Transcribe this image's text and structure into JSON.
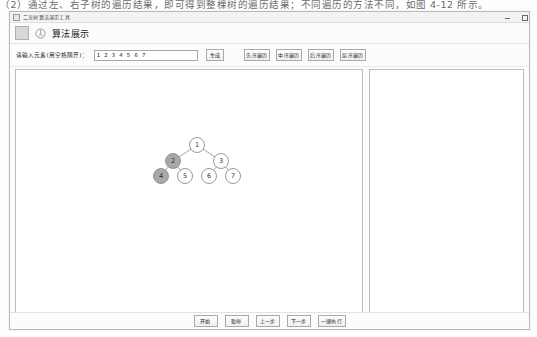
{
  "document_line": {
    "text": "（2）通过左、右子树的遍历结果，即可得到整棵树的遍历结果；不同遍历的方法不同，如图 4-12 所示。"
  },
  "window": {
    "titlebar_text": "二叉树算法演示工具",
    "controls": {
      "minimize": "minimize-icon",
      "close": "close-icon"
    },
    "app_icon": "app-square-icon",
    "logo_icon": "tree-logo-icon",
    "app_title": "算法展示"
  },
  "input_row": {
    "label": "请输入元素(用空格隔开)：",
    "value": "1 2 3 4 5 6 7",
    "placeholder": "1 2 3 4 5 6 7",
    "generate_button": "生成",
    "traversal_buttons": [
      {
        "label": "先序遍历",
        "name": "preorder-traversal-button"
      },
      {
        "label": "中序遍历",
        "name": "inorder-traversal-button"
      },
      {
        "label": "后序遍历",
        "name": "postorder-traversal-button"
      },
      {
        "label": "层序遍历",
        "name": "levelorder-traversal-button"
      }
    ]
  },
  "tree": {
    "nodes": [
      {
        "id": "n1",
        "label": "1",
        "cx": 187,
        "cy": 132,
        "r": 7.5,
        "highlight": false
      },
      {
        "id": "n2",
        "label": "2",
        "cx": 163,
        "cy": 148,
        "r": 7.5,
        "highlight": true
      },
      {
        "id": "n3",
        "label": "3",
        "cx": 211,
        "cy": 148,
        "r": 7.5,
        "highlight": false
      },
      {
        "id": "n4",
        "label": "4",
        "cx": 151,
        "cy": 163,
        "r": 7.5,
        "highlight": true
      },
      {
        "id": "n5",
        "label": "5",
        "cx": 175,
        "cy": 163,
        "r": 7.5,
        "highlight": false
      },
      {
        "id": "n6",
        "label": "6",
        "cx": 199,
        "cy": 163,
        "r": 7.5,
        "highlight": false
      },
      {
        "id": "n7",
        "label": "7",
        "cx": 223,
        "cy": 163,
        "r": 7.5,
        "highlight": false
      }
    ],
    "edges": [
      {
        "from": "n1",
        "to": "n2"
      },
      {
        "from": "n1",
        "to": "n3"
      },
      {
        "from": "n2",
        "to": "n4"
      },
      {
        "from": "n2",
        "to": "n5"
      },
      {
        "from": "n3",
        "to": "n6"
      },
      {
        "from": "n3",
        "to": "n7"
      }
    ],
    "colors": {
      "node_fill": "#ffffff",
      "node_stroke": "#8e8e8e",
      "node_highlight_fill": "#a8a8a8",
      "edge": "#9a9a9a",
      "label": "#333333"
    }
  },
  "side_panel": {
    "content": ""
  },
  "bottom_bar": {
    "buttons": [
      {
        "label": "开始",
        "name": "start-button"
      },
      {
        "label": "暂停",
        "name": "pause-button"
      },
      {
        "label": "上一步",
        "name": "prev-step-button"
      },
      {
        "label": "下一步",
        "name": "next-step-button"
      },
      {
        "label": "一键执行",
        "name": "run-all-button"
      }
    ]
  }
}
